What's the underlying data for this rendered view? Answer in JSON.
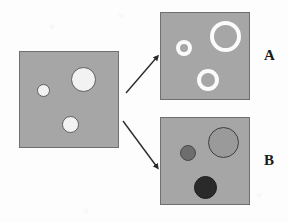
{
  "figure": {
    "caption": "",
    "background_color": "#fdfdfd",
    "panel_fill": "#a6a6a6",
    "panel_border": "#6f6f6f"
  },
  "source_panel": {
    "name": "source-square",
    "x": 19,
    "y": 51,
    "width": 100,
    "height": 97,
    "fill": "#a6a6a6",
    "border": "#6f6f6f",
    "circles": [
      {
        "label": "small-white-circle",
        "cx": 42,
        "cy": 89,
        "r": 6.5,
        "fill": "#f2f2f2",
        "stroke": "#5e5e5e",
        "stroke_width": 1
      },
      {
        "label": "large-white-circle",
        "cx": 82,
        "cy": 78,
        "r": 12.5,
        "fill": "#f2f2f2",
        "stroke": "#5e5e5e",
        "stroke_width": 1
      },
      {
        "label": "medium-white-circle",
        "cx": 69,
        "cy": 123,
        "r": 8.5,
        "fill": "#f2f2f2",
        "stroke": "#5e5e5e",
        "stroke_width": 1
      }
    ]
  },
  "panel_a": {
    "name": "panel-a",
    "label": "A",
    "label_x": 264,
    "label_y": 48,
    "x": 160,
    "y": 12,
    "width": 90,
    "height": 88,
    "fill": "#a6a6a6",
    "border": "#6f6f6f",
    "circles": [
      {
        "label": "small-white-ring",
        "cx": 183,
        "cy": 47,
        "r": 8,
        "fill": "transparent",
        "stroke": "#fbfbfb",
        "stroke_width": 4
      },
      {
        "label": "large-white-ring",
        "cx": 224,
        "cy": 35,
        "r": 15.5,
        "fill": "transparent",
        "stroke": "#fbfbfb",
        "stroke_width": 4.5
      },
      {
        "label": "medium-white-ring",
        "cx": 207,
        "cy": 79,
        "r": 11,
        "fill": "transparent",
        "stroke": "#fbfbfb",
        "stroke_width": 4
      }
    ]
  },
  "panel_b": {
    "name": "panel-b",
    "label": "B",
    "label_x": 264,
    "label_y": 153,
    "x": 160,
    "y": 117,
    "width": 90,
    "height": 88,
    "fill": "#a6a6a6",
    "border": "#6f6f6f",
    "circles": [
      {
        "label": "small-dark-gray-circle",
        "cx": 187,
        "cy": 152,
        "r": 8,
        "fill": "#6d6d6d",
        "stroke": "#4a4a4a",
        "stroke_width": 1
      },
      {
        "label": "large-medium-gray-circle",
        "cx": 222,
        "cy": 141,
        "r": 15.5,
        "fill": "#9a9a9a",
        "stroke": "#3f3f3f",
        "stroke_width": 1
      },
      {
        "label": "medium-black-circle",
        "cx": 204,
        "cy": 186,
        "r": 11.5,
        "fill": "#2a2a2a",
        "stroke": "#1c1c1c",
        "stroke_width": 1
      }
    ]
  },
  "arrows": [
    {
      "name": "arrow-to-panel-a",
      "x1": 126,
      "y1": 93,
      "x2": 157,
      "y2": 57,
      "color": "#2b2b2b",
      "width": 1.4
    },
    {
      "name": "arrow-to-panel-b",
      "x1": 123,
      "y1": 121,
      "x2": 157,
      "y2": 167,
      "color": "#2b2b2b",
      "width": 1.4
    }
  ]
}
